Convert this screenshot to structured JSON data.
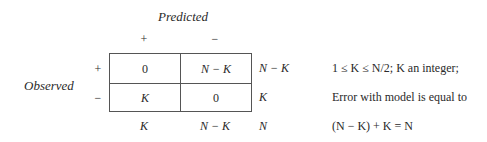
{
  "table": {
    "column_header": "Predicted",
    "row_header": "Observed",
    "column_signs": [
      "+",
      "−"
    ],
    "row_signs": [
      "+",
      "−"
    ],
    "cells": [
      [
        "0",
        "N − K"
      ],
      [
        "K",
        "0"
      ]
    ],
    "row_totals": [
      "N − K",
      "K"
    ],
    "column_totals": [
      "K",
      "N − K"
    ],
    "grand_total": "N"
  },
  "notes": [
    "1 ≤ K ≤ N/2; K an integer;",
    "Error with model is equal to",
    "(N − K) + K = N"
  ]
}
